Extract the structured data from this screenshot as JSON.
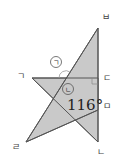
{
  "diagram": {
    "type": "geometry",
    "colors": {
      "fill": "#c9c9c9",
      "stroke": "#555555",
      "text": "#222222",
      "background": "#ffffff"
    },
    "points": {
      "giyeok": {
        "label": "ㄱ",
        "x": 32,
        "y": 78
      },
      "nieun": {
        "label": "ㄴ",
        "x": 98,
        "y": 142
      },
      "digeut": {
        "label": "ㄷ",
        "x": 98,
        "y": 78
      },
      "rieul": {
        "label": "ㄹ",
        "x": 26,
        "y": 142
      },
      "mieum": {
        "label": "ㅁ",
        "x": 98,
        "y": 110
      },
      "bieup": {
        "label": "ㅂ",
        "x": 98,
        "y": 28
      }
    },
    "triangles": [
      {
        "name": "triangle-giyeok-digeut-nieun",
        "vertices": [
          "ㄱ",
          "ㄷ",
          "ㄴ"
        ]
      },
      {
        "name": "triangle-bieup-rieul-mieum",
        "vertices": [
          "ㅂ",
          "ㄹ",
          "ㅁ"
        ]
      }
    ],
    "angle_markers": {
      "a": {
        "label": "ㄱ",
        "circled": true
      },
      "b": {
        "label": "ㄴ",
        "circled": true
      }
    },
    "angle_value": "116°"
  }
}
